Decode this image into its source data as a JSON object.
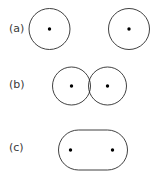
{
  "figure": {
    "width": 160,
    "height": 178,
    "background_color": "#ffffff",
    "stroke_color": "#2b2b2b",
    "stroke_width": 0.9,
    "dot_color": "#000000",
    "label_color": "#3a3a3a"
  },
  "panels": [
    {
      "id": "a",
      "label": "(a)",
      "state": "separated",
      "label_position": {
        "x": 9,
        "y": 23
      },
      "shapes": [
        {
          "kind": "circle",
          "cx": 49.5,
          "cy": 29.0,
          "r": 20.5
        },
        {
          "kind": "circle",
          "cx": 129.0,
          "cy": 29.0,
          "r": 20.5
        }
      ],
      "dots": [
        {
          "cx": 49.5,
          "cy": 29.0,
          "r": 1.7
        },
        {
          "cx": 129.0,
          "cy": 29.0,
          "r": 1.7
        }
      ]
    },
    {
      "id": "b",
      "label": "(b)",
      "state": "tangent-overlapping",
      "label_position": {
        "x": 9,
        "y": 79
      },
      "shapes": [
        {
          "kind": "circle",
          "cx": 71.5,
          "cy": 86.0,
          "r": 19.0
        },
        {
          "kind": "circle",
          "cx": 107.5,
          "cy": 86.0,
          "r": 19.0
        }
      ],
      "dots": [
        {
          "cx": 71.5,
          "cy": 86.0,
          "r": 1.7
        },
        {
          "cx": 107.5,
          "cy": 86.0,
          "r": 1.7
        }
      ],
      "overlap": {
        "left_x": 88.5,
        "right_x": 90.5,
        "top_y": 79.5,
        "bottom_y": 92.5
      }
    },
    {
      "id": "c",
      "label": "(c)",
      "state": "coalesced",
      "label_position": {
        "x": 9,
        "y": 142
      },
      "shapes": [
        {
          "kind": "stadium",
          "x": 58.5,
          "y": 130.0,
          "width": 69.0,
          "height": 40.0,
          "rx": 20.0,
          "ry": 20.0
        }
      ],
      "dots": [
        {
          "cx": 70.5,
          "cy": 150.0,
          "r": 1.7
        },
        {
          "cx": 112.5,
          "cy": 150.0,
          "r": 1.7
        }
      ]
    }
  ]
}
